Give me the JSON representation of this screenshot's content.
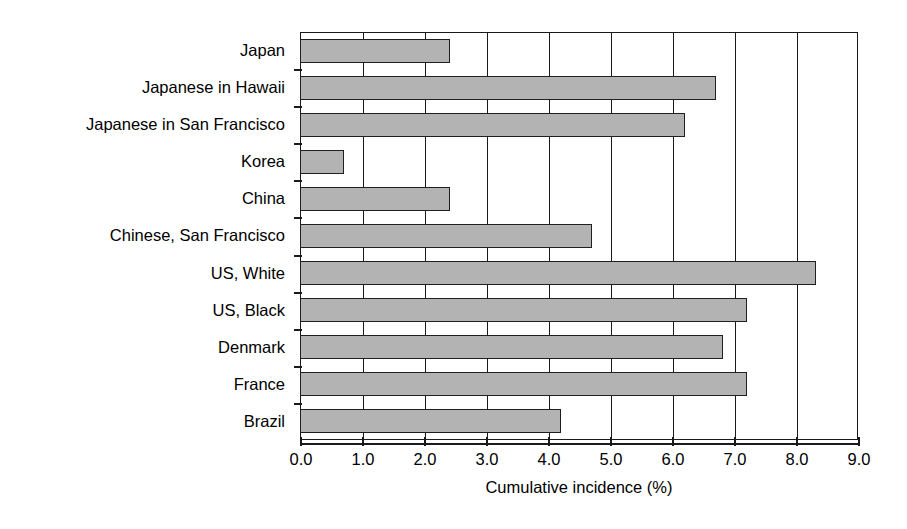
{
  "ghost_text": {
    "top_band": "",
    "mid_band": ""
  },
  "chart_data": {
    "type": "bar",
    "orientation": "horizontal",
    "title": "",
    "subtitle": "",
    "xlabel": "Cumulative incidence (%)",
    "ylabel": "",
    "xlim": [
      0.0,
      9.0
    ],
    "xticks": [
      "0.0",
      "1.0",
      "2.0",
      "3.0",
      "4.0",
      "5.0",
      "6.0",
      "7.0",
      "8.0",
      "9.0"
    ],
    "xtick_values": [
      0.0,
      1.0,
      2.0,
      3.0,
      4.0,
      5.0,
      6.0,
      7.0,
      8.0,
      9.0
    ],
    "grid": "vertical",
    "legend": "none",
    "bar_color": "#b3b3b3",
    "bar_border_color": "#1f1f1f",
    "axis_color": "#1a1a1a",
    "categories": [
      "Japan",
      "Japanese in Hawaii",
      "Japanese in San Francisco",
      "Korea",
      "China",
      "Chinese, San Francisco",
      "US, White",
      "US, Black",
      "Denmark",
      "France",
      "Brazil"
    ],
    "values": [
      2.4,
      6.7,
      6.2,
      0.7,
      2.4,
      4.7,
      8.3,
      7.2,
      6.8,
      7.2,
      4.2
    ]
  }
}
